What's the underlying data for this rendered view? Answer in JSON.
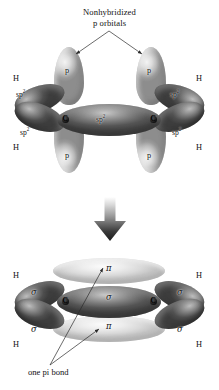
{
  "figure": {
    "title": "Nonhybridized p orbitals",
    "background_color": "#ffffff",
    "text_color": "#121212"
  },
  "top_diagram": {
    "annotation": {
      "line1": "Nonhybridized",
      "line2": "p orbitals"
    },
    "atoms": [
      {
        "symbol": "C",
        "side": "left"
      },
      {
        "symbol": "C",
        "side": "right"
      }
    ],
    "hydrogen_labels": [
      {
        "text": "H",
        "position": "upper-left"
      },
      {
        "text": "H",
        "position": "lower-left"
      },
      {
        "text": "H",
        "position": "upper-right"
      },
      {
        "text": "H",
        "position": "lower-right"
      }
    ],
    "p_orbital_labels": [
      {
        "text": "p",
        "position": "top-left"
      },
      {
        "text": "p",
        "position": "top-right"
      },
      {
        "text": "p",
        "position": "bottom-left"
      },
      {
        "text": "p",
        "position": "bottom-right"
      }
    ],
    "hybrid_orbital_labels": [
      {
        "base": "sp",
        "exponent": "2",
        "position": "upper-left"
      },
      {
        "base": "sp",
        "exponent": "2",
        "position": "lower-left"
      },
      {
        "base": "sp",
        "exponent": "2",
        "position": "center"
      },
      {
        "base": "sp",
        "exponent": "2",
        "position": "upper-right"
      },
      {
        "base": "sp",
        "exponent": "2",
        "position": "lower-right"
      }
    ]
  },
  "transition": {
    "icon": "down-arrow-icon"
  },
  "bottom_diagram": {
    "atoms": [
      {
        "symbol": "C",
        "side": "left"
      },
      {
        "symbol": "C",
        "side": "right"
      }
    ],
    "hydrogen_labels": [
      {
        "text": "H",
        "position": "upper-left"
      },
      {
        "text": "H",
        "position": "lower-left"
      },
      {
        "text": "H",
        "position": "upper-right"
      },
      {
        "text": "H",
        "position": "lower-right"
      }
    ],
    "sigma_labels": [
      {
        "text": "σ",
        "position": "upper-left"
      },
      {
        "text": "σ",
        "position": "lower-left"
      },
      {
        "text": "σ",
        "position": "center"
      },
      {
        "text": "σ",
        "position": "upper-right"
      },
      {
        "text": "σ",
        "position": "lower-right"
      }
    ],
    "pi_labels": [
      {
        "text": "π",
        "position": "top"
      },
      {
        "text": "π",
        "position": "bottom"
      }
    ],
    "caption": "one pi bond"
  }
}
